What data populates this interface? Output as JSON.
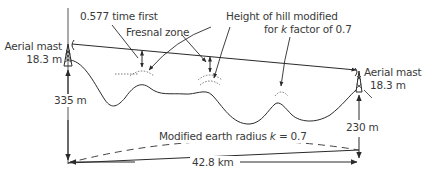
{
  "diagram": {
    "left_mast": {
      "label": "Aerial mast",
      "height": "18.3 m",
      "ground_height": "335 m"
    },
    "right_mast": {
      "label": "Aerial mast",
      "height": "18.3 m",
      "ground_height": "230 m"
    },
    "annotations": {
      "fresnel_line1": "0.577 time first",
      "fresnel_line2": "Fresnal zone",
      "hill_line1": "Height of hill modified",
      "hill_line2_pre": "for ",
      "hill_line2_k": "k",
      "hill_line2_post": " factor of 0.7"
    },
    "earth_curve": {
      "label_pre": "Modified earth radius ",
      "label_k": "k",
      "label_post": " = 0.7"
    },
    "distance": "42.8 km",
    "colors": {
      "line": "#2a2a2a",
      "text": "#3a3a3a",
      "background": "#ffffff"
    }
  }
}
